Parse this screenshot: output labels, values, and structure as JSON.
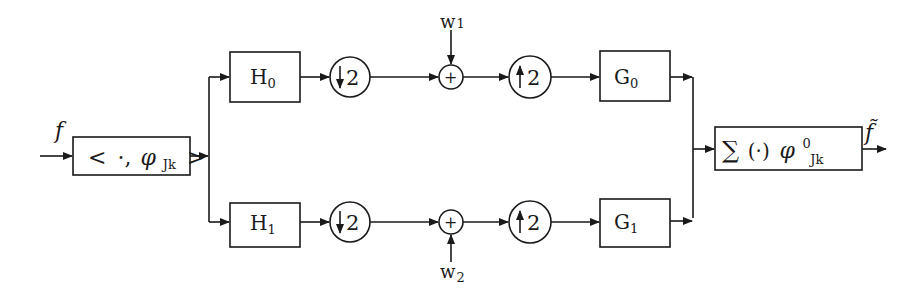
{
  "diagram": {
    "type": "two-channel filter bank block diagram",
    "input_label": "f",
    "output_label": "f̃",
    "analysis_block": {
      "open": "<",
      "dot": "·,",
      "phi": "φ",
      "sub": "Jk",
      "close": ">"
    },
    "synthesis_block": {
      "sum": "∑",
      "paren": "(·)",
      "phi": "φ",
      "sup": "0",
      "sub": "Jk"
    },
    "branches": [
      {
        "name": "upper",
        "analysis_filter": {
          "base": "H",
          "sub": "0"
        },
        "downsampler": {
          "arrow": "↓",
          "factor": "2"
        },
        "adder": "+",
        "noise": {
          "base": "w",
          "sub": "1"
        },
        "upsampler": {
          "arrow": "↑",
          "factor": "2"
        },
        "synthesis_filter": {
          "base": "G",
          "sub": "0"
        }
      },
      {
        "name": "lower",
        "analysis_filter": {
          "base": "H",
          "sub": "1"
        },
        "downsampler": {
          "arrow": "↓",
          "factor": "2"
        },
        "adder": "+",
        "noise": {
          "base": "w",
          "sub": "2"
        },
        "upsampler": {
          "arrow": "↑",
          "factor": "2"
        },
        "synthesis_filter": {
          "base": "G",
          "sub": "1"
        }
      }
    ],
    "colors": {
      "ink": "#1a1a1a",
      "background": "#ffffff"
    }
  }
}
